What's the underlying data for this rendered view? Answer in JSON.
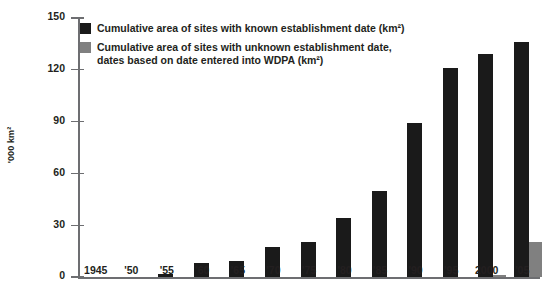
{
  "chart_data": {
    "type": "bar",
    "title": "",
    "xlabel": "",
    "ylabel": "'000 km²",
    "ylim": [
      0,
      150
    ],
    "yticks": [
      0,
      30,
      60,
      90,
      120,
      150
    ],
    "ytick_labels": [
      "0",
      "30",
      "60",
      "90",
      "120",
      "150"
    ],
    "grid": false,
    "legend_position": "top-left",
    "categories": [
      "1945",
      "'50",
      "'55",
      "'60",
      "'65",
      "'70",
      "'75",
      "'80",
      "'85",
      "'90",
      "'95",
      "2000",
      "'05"
    ],
    "series": [
      {
        "name": "Cumulative area of sites with known establishment date (km²)",
        "color": "#1a1a1a",
        "values": [
          0,
          0,
          2,
          8,
          9,
          17.5,
          20.5,
          34,
          50,
          89,
          121,
          129,
          136
        ]
      },
      {
        "name": "Cumulative area of sites with unknown establishment date, dates based on date entered into WDPA (km²)",
        "color": "#808080",
        "values": [
          0,
          0,
          0,
          0,
          0,
          0,
          0,
          0,
          0,
          0,
          0,
          1,
          20
        ]
      }
    ]
  },
  "legend": {
    "items": [
      {
        "swatch": "known",
        "line1": "Cumulative area of sites with known establishment date (km²)",
        "line2": ""
      },
      {
        "swatch": "unknown",
        "line1": "Cumulative area of sites with unknown establishment date,",
        "line2": "dates based on date entered into WDPA (km²)"
      }
    ]
  },
  "axes": {
    "y_title": "'000 km²"
  }
}
